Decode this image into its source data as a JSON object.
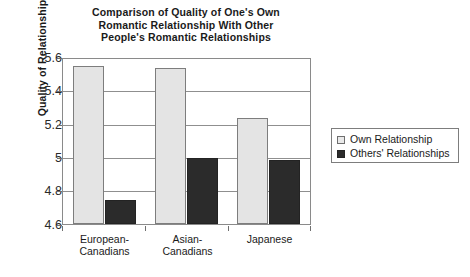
{
  "chart_data": {
    "type": "bar",
    "title": "Comparison of Quality of One's Own Romantic Relationship With Other People's Romantic Relationships",
    "title_lines": [
      "Comparison of Quality of One's Own",
      "Romantic Relationship With Other",
      "People's Romantic Relationships"
    ],
    "xlabel": "",
    "ylabel": "Quality of Relationship",
    "ylim": [
      4.6,
      5.6
    ],
    "ytick_labels": [
      "5.6",
      "5.4",
      "5.2",
      "5",
      "4.8",
      "4.6"
    ],
    "ytick_values": [
      5.6,
      5.4,
      5.2,
      5.0,
      4.8,
      4.6
    ],
    "grid": true,
    "legend_position": "right",
    "categories": [
      "European-Canadians",
      "Asian-Canadians",
      "Japanese"
    ],
    "category_lines": [
      [
        "European-",
        "Canadians"
      ],
      [
        "Asian-",
        "Canadians"
      ],
      [
        "Japanese"
      ]
    ],
    "series": [
      {
        "name": "Own Relationship",
        "color": "#e4e4e4",
        "edge_color": "#7d7d7d",
        "values": [
          5.56,
          5.545,
          5.24
        ]
      },
      {
        "name": "Others' Relationships",
        "color": "#2b2b2b",
        "edge_color": "#232323",
        "values": [
          4.745,
          5.0,
          4.99
        ]
      }
    ]
  },
  "legend": {
    "items": [
      {
        "label": "Own Relationship",
        "swatch": "light-square-swatch"
      },
      {
        "label": "Others' Relationships",
        "swatch": "dark-square-swatch"
      }
    ]
  },
  "colors": {
    "own_relationship": "#e4e4e4",
    "others_relationships": "#2b2b2b",
    "axis": "#8a8a8a",
    "gridline": "#8f8f8f",
    "text": "#1a1a1a",
    "background": "#ffffff"
  }
}
